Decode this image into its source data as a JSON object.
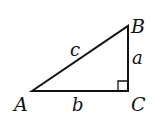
{
  "diagram": {
    "type": "right-triangle",
    "vertices": {
      "A": {
        "label": "A",
        "x": 32,
        "y": 91
      },
      "B": {
        "label": "B",
        "x": 128,
        "y": 26
      },
      "C": {
        "label": "C",
        "x": 128,
        "y": 91
      }
    },
    "sides": {
      "a": {
        "label": "a",
        "between": [
          "B",
          "C"
        ]
      },
      "b": {
        "label": "b",
        "between": [
          "A",
          "C"
        ]
      },
      "c": {
        "label": "c",
        "between": [
          "A",
          "B"
        ]
      }
    },
    "right_angle_at": "C",
    "stroke_color": "#111111"
  }
}
